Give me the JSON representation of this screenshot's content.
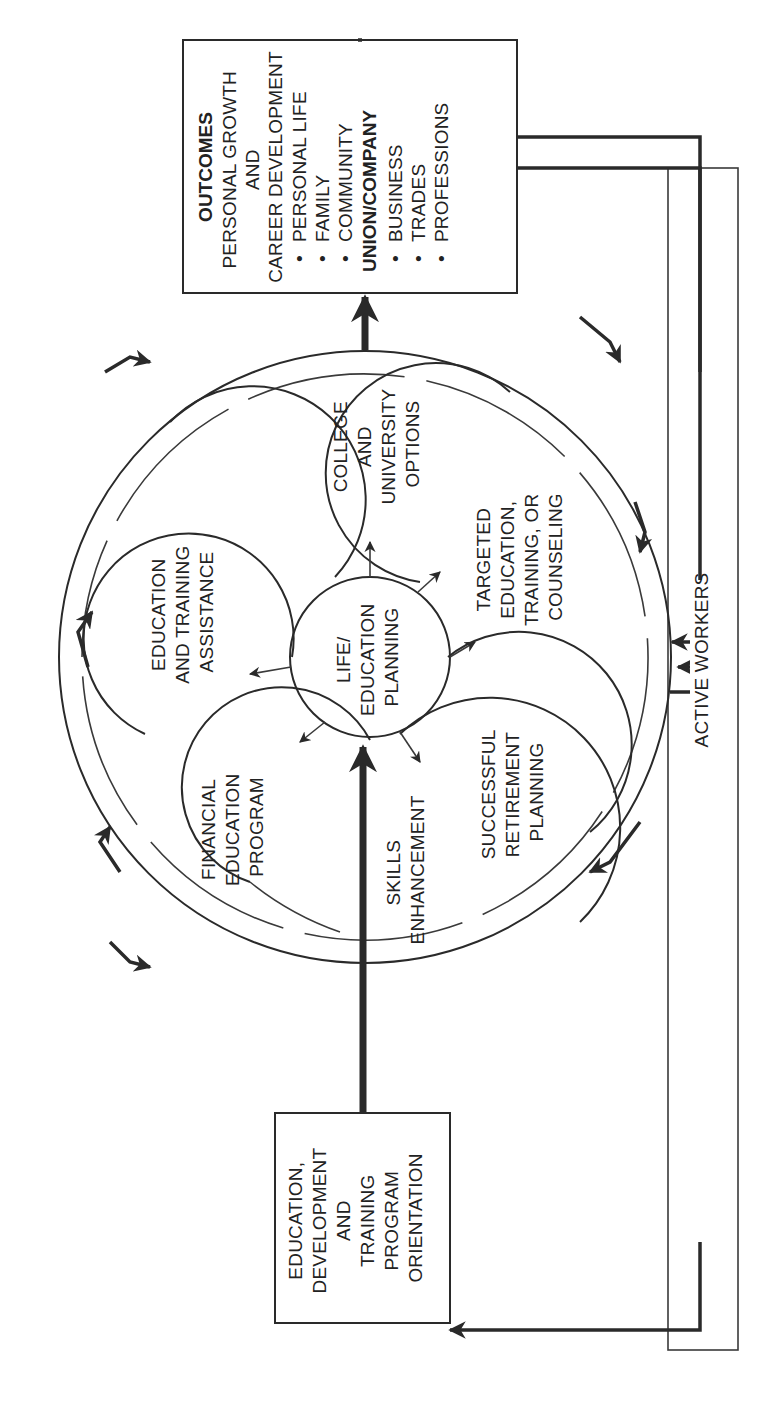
{
  "diagram": {
    "orientation": "rotated 90° counterclockwise",
    "center": {
      "label_lines": [
        "LIFE/",
        "EDUCATION",
        "PLANNING"
      ]
    },
    "petals": [
      {
        "id": "financial",
        "label_lines": [
          "FINANCIAL",
          "EDUCATION",
          "PROGRAM"
        ]
      },
      {
        "id": "education-training",
        "label_lines": [
          "EDUCATION",
          "AND TRAINING",
          "ASSISTANCE"
        ]
      },
      {
        "id": "college",
        "label_lines": [
          "COLLEGE",
          "AND",
          "UNIVERSITY",
          "OPTIONS"
        ]
      },
      {
        "id": "targeted",
        "label_lines": [
          "TARGETED",
          "EDUCATION,",
          "TRAINING, OR",
          "COUNSELING"
        ]
      },
      {
        "id": "retirement",
        "label_lines": [
          "SUCCESSFUL",
          "RETIREMENT",
          "PLANNING"
        ]
      },
      {
        "id": "skills",
        "label_lines": [
          "SKILLS",
          "ENHANCEMENT"
        ]
      }
    ],
    "input_box": {
      "label_lines": [
        "EDUCATION,",
        "DEVELOPMENT",
        "AND",
        "TRAINING",
        "PROGRAM",
        "ORIENTATION"
      ]
    },
    "outcomes_box": {
      "heading": "OUTCOMES",
      "subheading_lines": [
        "PERSONAL GROWTH",
        "AND",
        "CAREER DEVELOPMENT"
      ],
      "personal_items": [
        "PERSONAL LIFE",
        "FAMILY",
        "COMMUNITY"
      ],
      "group_heading": "UNION/COMPANY",
      "group_items": [
        "BUSINESS",
        "TRADES",
        "PROFESSIONS"
      ],
      "bullet": "•"
    },
    "feedback": {
      "label": "ACTIVE WORKERS"
    },
    "colors": {
      "ink": "#2a2a2a",
      "background": "#ffffff"
    }
  }
}
